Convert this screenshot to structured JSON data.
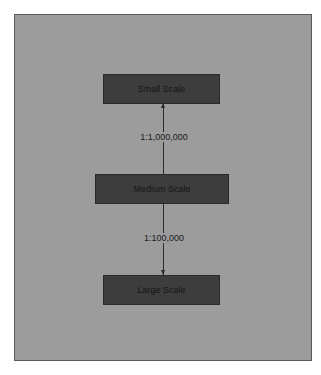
{
  "diagram": {
    "nodes": [
      {
        "id": "small",
        "label": "Small Scale"
      },
      {
        "id": "medium",
        "label": "Medium Scale"
      },
      {
        "id": "large",
        "label": "Large Scale"
      }
    ],
    "edges": [
      {
        "from": "medium",
        "to": "small",
        "label": "1:1,000,000",
        "direction": "up"
      },
      {
        "from": "medium",
        "to": "large",
        "label": "1:100,000",
        "direction": "down"
      }
    ],
    "colors": {
      "background": "#9c9c9c",
      "node_fill": "#3d3d3d",
      "line": "#2b2b2b"
    }
  }
}
